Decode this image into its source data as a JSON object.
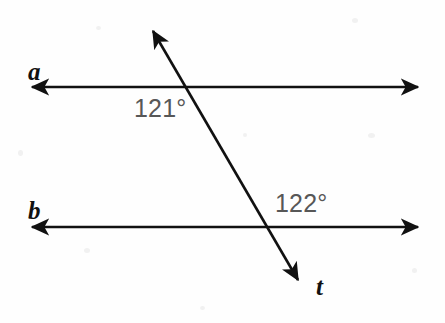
{
  "figure": {
    "type": "geometry-diagram",
    "width": 445,
    "height": 323,
    "background_color": "#fefefe",
    "stroke_color": "#111111",
    "angle_text_color": "#575757",
    "lines": [
      {
        "id": "line-a",
        "label": "a",
        "kind": "double-arrow-line",
        "x1": 25,
        "y1": 87,
        "x2": 425,
        "y2": 87
      },
      {
        "id": "line-b",
        "label": "b",
        "kind": "double-arrow-line",
        "x1": 25,
        "y1": 227,
        "x2": 425,
        "y2": 227
      },
      {
        "id": "line-t",
        "label": "t",
        "kind": "double-arrow-transversal",
        "x1": 148,
        "y1": 22,
        "x2": 303,
        "y2": 288
      }
    ],
    "intersections": [
      {
        "with": "line-a",
        "x": 196,
        "y": 87
      },
      {
        "with": "line-b",
        "x": 270,
        "y": 227
      }
    ],
    "angles": [
      {
        "id": "angle-121",
        "text": "121°",
        "value": 121,
        "unit": "degrees",
        "at_intersection": "line-a",
        "position": "below-left of intersection of t and a"
      },
      {
        "id": "angle-122",
        "text": "122°",
        "value": 122,
        "unit": "degrees",
        "at_intersection": "line-b",
        "position": "above-right of intersection of t and b"
      }
    ],
    "labels": {
      "line_a": "a",
      "line_b": "b",
      "transversal": "t",
      "angle_upper": "121°",
      "angle_lower": "122°"
    }
  }
}
